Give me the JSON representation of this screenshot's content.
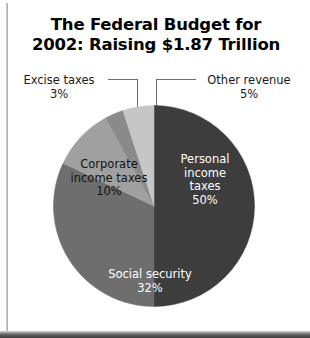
{
  "title": {
    "line1": "The Federal Budget for",
    "line2": "2002: Raising $1.87 Trillion"
  },
  "callouts": {
    "excise": {
      "name": "Excise taxes",
      "percent": "3%"
    },
    "other": {
      "name": "Other revenue",
      "percent": "5%"
    }
  },
  "slice_labels": {
    "personal": {
      "l1": "Personal",
      "l2": "income",
      "l3": "taxes",
      "l4": "50%"
    },
    "corporate": {
      "l1": "Corporate",
      "l2": "income taxes",
      "l3": "10%"
    },
    "social": {
      "l1": "Social security",
      "l2": "32%"
    }
  },
  "chart_data": {
    "type": "pie",
    "title": "The Federal Budget for 2002: Raising $1.87 Trillion",
    "unit": "percent",
    "total_label": "$1.87 Trillion",
    "start_angle_deg": 0,
    "direction": "clockwise",
    "legend": "none",
    "grid": false,
    "labels": [
      "Personal income taxes",
      "Social security",
      "Corporate income taxes",
      "Excise taxes",
      "Other revenue"
    ],
    "values": [
      50,
      32,
      10,
      3,
      5
    ],
    "colors": [
      "#3d3d3d",
      "#6e6e6e",
      "#a0a0a0",
      "#8a8a8a",
      "#c6c6c6"
    ],
    "slices": [
      {
        "label": "Personal income taxes",
        "value": 50,
        "display": "50%",
        "color": "#3d3d3d",
        "label_placement": "inside",
        "label_color": "#ffffff"
      },
      {
        "label": "Social security",
        "value": 32,
        "display": "32%",
        "color": "#6e6e6e",
        "label_placement": "inside",
        "label_color": "#ffffff"
      },
      {
        "label": "Corporate income taxes",
        "value": 10,
        "display": "10%",
        "color": "#a0a0a0",
        "label_placement": "inside",
        "label_color": "#111111"
      },
      {
        "label": "Excise taxes",
        "value": 3,
        "display": "3%",
        "color": "#8a8a8a",
        "label_placement": "callout-left",
        "label_color": "#1a1a1a"
      },
      {
        "label": "Other revenue",
        "value": 5,
        "display": "5%",
        "color": "#c6c6c6",
        "label_placement": "callout-right",
        "label_color": "#1a1a1a"
      }
    ]
  }
}
